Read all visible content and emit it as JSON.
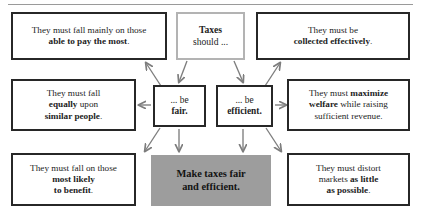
{
  "diagram": {
    "top_rule": true,
    "colors": {
      "box_border_dark": "#272727",
      "box_border_light": "#b3b3b3",
      "goal_fill": "#9d9d9d",
      "arrow": "#7d7d7d",
      "text": "#1d1d1d",
      "background": "#ffffff"
    },
    "nodes": {
      "taxes": {
        "id": "taxes-should",
        "line1": "Taxes",
        "line2": "should ...",
        "style": "light-box"
      },
      "fair": {
        "id": "be-fair",
        "line1": "... be",
        "line2": "fair.",
        "style": "dark-box"
      },
      "efficient": {
        "id": "be-efficient",
        "line1": "... be",
        "line2": "efficient.",
        "style": "dark-box"
      },
      "ability": {
        "id": "ability-to-pay",
        "line1": "They must fall mainly on those",
        "line2": "able to pay the most",
        "line2_tail": ".",
        "style": "dark-box"
      },
      "collected": {
        "id": "collected-effectively",
        "line1": "They must be",
        "line2": "collected effectively",
        "line2_tail": ".",
        "style": "dark-box"
      },
      "equally": {
        "id": "equally-similar-people",
        "line1": "They must fall",
        "line2_a": "equally",
        "line2_b": " upon",
        "line3": "similar people",
        "line3_tail": ".",
        "style": "dark-box"
      },
      "welfare": {
        "id": "maximize-welfare",
        "line1_a": "They must ",
        "line1_b": "maximize",
        "line2_a": "welfare",
        "line2_b": " while raising",
        "line3": "sufficient revenue.",
        "style": "dark-box"
      },
      "benefit": {
        "id": "most-likely-to-benefit",
        "line1": "They must fall on those",
        "line2": "most likely",
        "line3": "to benefit",
        "line3_tail": ".",
        "style": "dark-box"
      },
      "distort": {
        "id": "distort-markets-least",
        "line1": "They must distort",
        "line2_a": "markets ",
        "line2_b": "as little",
        "line3": "as possible",
        "line3_tail": ".",
        "style": "dark-box"
      },
      "goal": {
        "id": "make-taxes-fair-and-efficient",
        "line1": "Make taxes fair",
        "line2": "and efficient.",
        "style": "gray-fill"
      }
    },
    "edges": [
      {
        "from": "taxes",
        "to": "fair",
        "direction": "down"
      },
      {
        "from": "taxes",
        "to": "efficient",
        "direction": "down"
      },
      {
        "from": "fair",
        "to": "ability",
        "direction": "up-left"
      },
      {
        "from": "fair",
        "to": "equally",
        "direction": "left"
      },
      {
        "from": "fair",
        "to": "benefit",
        "direction": "down-left"
      },
      {
        "from": "fair",
        "to": "goal",
        "direction": "down"
      },
      {
        "from": "efficient",
        "to": "collected",
        "direction": "up-right"
      },
      {
        "from": "efficient",
        "to": "welfare",
        "direction": "right"
      },
      {
        "from": "efficient",
        "to": "distort",
        "direction": "down-right"
      },
      {
        "from": "efficient",
        "to": "goal",
        "direction": "down"
      }
    ]
  }
}
